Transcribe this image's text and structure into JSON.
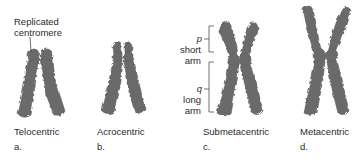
{
  "figure": {
    "annotations": {
      "centromere": "Replicated\ncentromere",
      "centromere_line1": "Replicated",
      "centromere_line2": "centromere",
      "p": "p",
      "short_arm_1": "short",
      "short_arm_2": "arm",
      "q": "q",
      "long_arm_1": "long",
      "long_arm_2": "arm"
    },
    "panels": [
      {
        "name": "Telocentric",
        "letter": "a."
      },
      {
        "name": "Acrocentric",
        "letter": "b."
      },
      {
        "name": "Submetacentric",
        "letter": "c."
      },
      {
        "name": "Metacentric",
        "letter": "d."
      }
    ],
    "colors": {
      "chromatid": "#6b6b6b",
      "chromatid_edge": "#555555",
      "text": "#2a2a2a",
      "background": "#ffffff"
    }
  }
}
